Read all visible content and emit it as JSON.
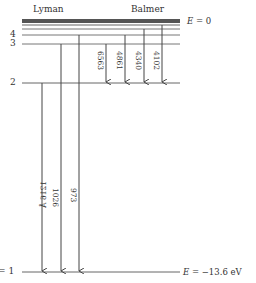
{
  "diagram": {
    "series_labels": {
      "lyman": "Lyman",
      "balmer": "Balmer"
    },
    "energy_labels": {
      "top_prefix": "E",
      "top_value": "= 0",
      "bottom_prefix": "E",
      "bottom_value": "= −13.6 eV"
    },
    "levels": [
      {
        "n": "1",
        "label": "= 1",
        "y": 272
      },
      {
        "n": "2",
        "label": "2",
        "y": 83
      },
      {
        "n": "3",
        "label": "3",
        "y": 44
      },
      {
        "n": "4",
        "label": "4",
        "y": 35
      }
    ],
    "convergence_lines_y": [
      20,
      22,
      24,
      28
    ],
    "lyman_transitions": [
      {
        "from": 2,
        "to": 1,
        "wavelength": "1216 Å",
        "x": 42
      },
      {
        "from": 3,
        "to": 1,
        "wavelength": "1026",
        "x": 61
      },
      {
        "from": 4,
        "to": 1,
        "wavelength": "973",
        "x": 79
      }
    ],
    "balmer_transitions": [
      {
        "from": 3,
        "to": 2,
        "wavelength": "6563",
        "x": 106
      },
      {
        "from": 4,
        "to": 2,
        "wavelength": "4861",
        "x": 125
      },
      {
        "from": 5,
        "to": 2,
        "wavelength": "4340",
        "x": 144
      },
      {
        "from": 6,
        "to": 2,
        "wavelength": "4102",
        "x": 162
      }
    ]
  }
}
